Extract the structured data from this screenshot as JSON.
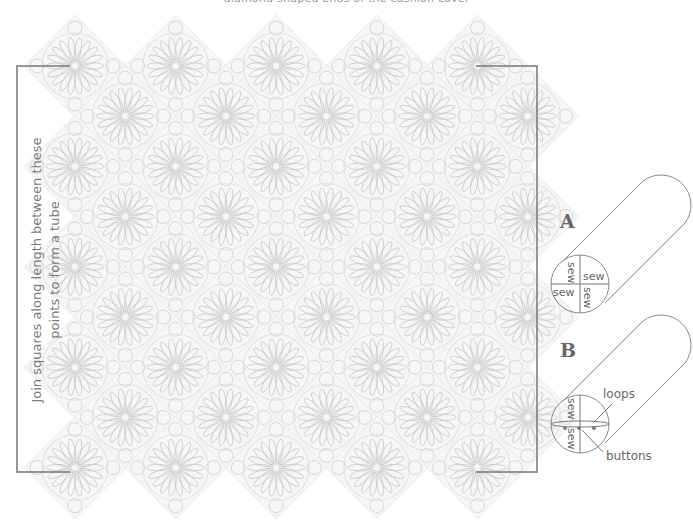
{
  "caption_top": "diamond-shaped ends of the cushion cover",
  "side_instruction": {
    "line1": "Join squares along length between these",
    "line2": "points to form a tube"
  },
  "diagram_a": {
    "letter": "A",
    "quadrant_labels": [
      "sew",
      "sew",
      "sew",
      "sew"
    ]
  },
  "diagram_b": {
    "letter": "B",
    "quadrant_labels": [
      "sew",
      "sew"
    ],
    "callouts": {
      "loops": "loops",
      "buttons": "buttons"
    }
  },
  "colors": {
    "bracket": "#777777",
    "lace": "#c9c9c9",
    "lace_light": "#e4e4e4",
    "line_art": "#8a8a8a",
    "text": "#666666"
  }
}
